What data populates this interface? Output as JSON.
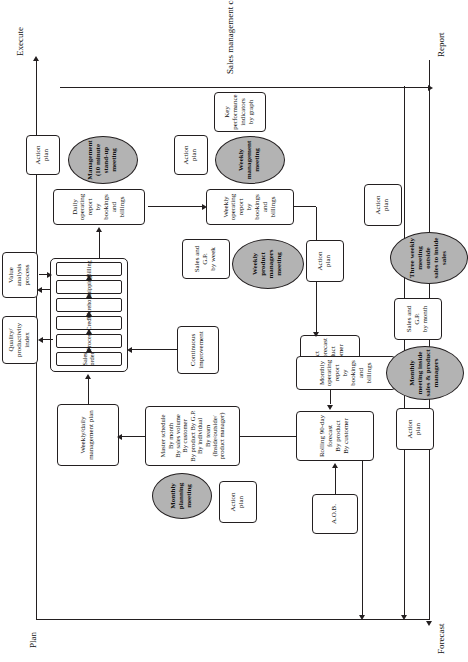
{
  "figure": {
    "caption": "Sales management control system.",
    "axes": {
      "plan": "Plan",
      "execute": "Execute",
      "forecast": "Forecast",
      "report": "Report"
    }
  },
  "nodes": {
    "aob": "A.O.B.",
    "rolling_forecast": "Rolling 90-day\nforecast\nBy product\nBy customer",
    "product_manager_forecast": "Product\nmanager forecast\nBy product\nBy customer",
    "master_schedule": "Master schedule\nBy month\nBy sales volume\nBy customer\nBy product By G.P.\nBy individual\nBy team\n(Inside/outside/\nproduct manager)",
    "weekly_daily_plan": "Weekly/daily\nmanagement plan",
    "continuous_improvement": "Continuous\nimprovement",
    "quality_productivity_index": "Quality/\nproductivity\nindex",
    "value_analysis_process": "Value\nanalysis\nprocess",
    "daily_operating_report": "Daily operating report\nby bookings and billings",
    "weekly_operating_report": "Weekly operating report\nby bookings and billings",
    "monthly_operating_report": "Monthly operating report\nby bookings and billings",
    "sales_gp_week": "Sales and\nG.P.\nby week",
    "sales_gp_month": "Sales and\nG.P.\nby month",
    "kpi_graph": "Key\nperformance\nindicators\nby graph",
    "action_plan": "Action\nplan"
  },
  "process_chain": {
    "steps": [
      "Sales order",
      "Process",
      "Credit",
      "Warehouse",
      "Shipping",
      "Billing"
    ]
  },
  "meetings": {
    "monthly_planning": "Monthly\nplanning\nmeeting",
    "management_standup": "Management\n(10 minute stand-up\nmeeting",
    "weekly_product_managers": "Weekly\nproduct managers\nmeeting",
    "weekly_management": "Weekly\nmanagement\nmeeting",
    "monthly_inside_product": "Monthly\nmeeting inside\nsales & product\nmanagers",
    "three_weekly_outside_inside": "Three weekly\nmeeting outside\nsales to inside\nsales"
  },
  "action_plans": {
    "planning": "Action\nplan",
    "standup": "Action\nplan",
    "product_managers": "Action\nplan",
    "management": "Action\nplan",
    "monthly_inside": "Action\nplan",
    "three_weekly": "Action\nplan"
  },
  "colors": {
    "line": "#231f20",
    "meeting_fill": "#b3b3b3",
    "box_fill": "#ffffff"
  }
}
